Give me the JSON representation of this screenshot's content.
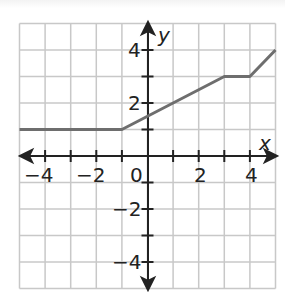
{
  "chart_data": {
    "type": "line",
    "title": "",
    "xlabel": "x",
    "ylabel": "y",
    "xlim": [
      -5,
      5
    ],
    "ylim": [
      -5,
      5
    ],
    "grid": true,
    "x_tick_labels": [
      "-4",
      "-2",
      "0",
      "2",
      "4"
    ],
    "y_tick_labels": [
      "4",
      "2",
      "-2",
      "-4"
    ],
    "series": [
      {
        "name": "piecewise function",
        "points": [
          [
            -5,
            1
          ],
          [
            -1,
            1
          ],
          [
            3,
            3
          ],
          [
            4,
            3
          ],
          [
            5,
            4
          ]
        ]
      }
    ],
    "colors": {
      "line": "#6e6e6e",
      "grid": "#c8c8c8",
      "axis": "#222222"
    }
  },
  "labels": {
    "x_axis": "x",
    "y_axis": "y",
    "origin": "0",
    "xn4": "−4",
    "xn2": "−2",
    "x2": "2",
    "x4": "4",
    "y4": "4",
    "y2": "2",
    "yn2": "−2",
    "yn4": "−4"
  }
}
